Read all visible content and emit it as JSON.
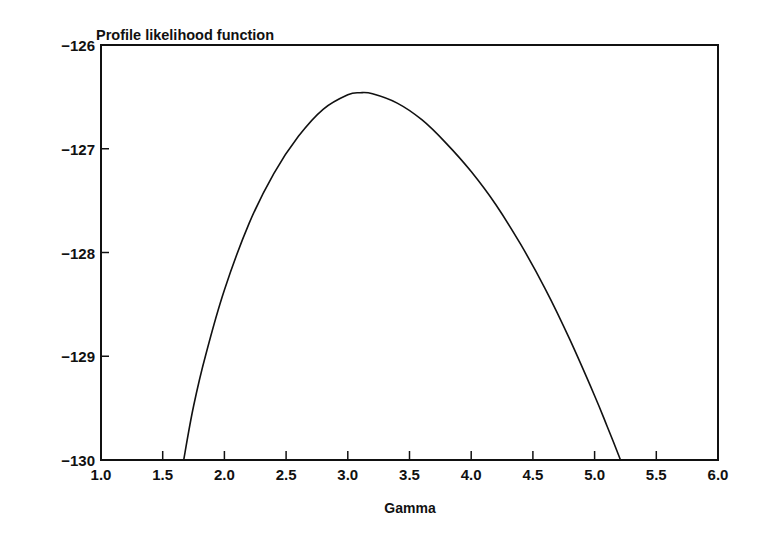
{
  "chart_data": {
    "type": "line",
    "title": "Profile likelihood function",
    "xlabel": "Gamma",
    "ylabel": "",
    "xlim": [
      1.0,
      6.0
    ],
    "ylim": [
      -130,
      -126
    ],
    "x_ticks": [
      "1.0",
      "1.5",
      "2.0",
      "2.5",
      "3.0",
      "3.5",
      "4.0",
      "4.5",
      "5.0",
      "5.5",
      "6.0"
    ],
    "y_ticks": [
      "-126",
      "-127",
      "-128",
      "-129",
      "-130"
    ],
    "grid": false,
    "legend": null,
    "series": [
      {
        "name": "Profile likelihood",
        "x": [
          1.67,
          1.75,
          1.85,
          2.0,
          2.2,
          2.4,
          2.6,
          2.8,
          3.0,
          3.1,
          3.2,
          3.4,
          3.6,
          3.8,
          4.0,
          4.2,
          4.4,
          4.6,
          4.8,
          5.0,
          5.1,
          5.21
        ],
        "y": [
          -130.0,
          -129.48,
          -128.98,
          -128.36,
          -127.72,
          -127.24,
          -126.88,
          -126.62,
          -126.48,
          -126.46,
          -126.47,
          -126.56,
          -126.72,
          -126.95,
          -127.22,
          -127.54,
          -127.92,
          -128.35,
          -128.84,
          -129.38,
          -129.67,
          -130.0
        ]
      }
    ],
    "peak": {
      "x": 3.1,
      "y": -126.46
    }
  }
}
